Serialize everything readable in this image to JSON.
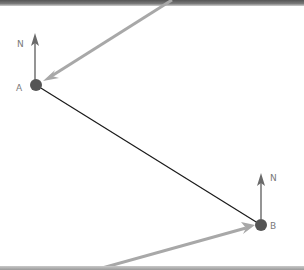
{
  "diagram": {
    "points": [
      {
        "id": "A",
        "label": "A",
        "x": 36,
        "y": 85
      },
      {
        "id": "B",
        "label": "B",
        "x": 261,
        "y": 225
      }
    ],
    "north_labels": [
      {
        "at": "A",
        "label": "N"
      },
      {
        "at": "B",
        "label": "N"
      }
    ],
    "connector": {
      "from": "A",
      "to": "B",
      "color": "#1a1a1a"
    },
    "incoming_arrows": [
      {
        "to": "A",
        "from_edge": "top",
        "color": "#a8a8a8"
      },
      {
        "to": "B",
        "from_edge": "bottom",
        "color": "#a8a8a8"
      }
    ],
    "colors": {
      "point": "#555555",
      "north_arrow": "#7a7a7a",
      "label": "#7a7a7a",
      "incoming_arrow": "#a8a8a8",
      "connector": "#1a1a1a"
    }
  }
}
